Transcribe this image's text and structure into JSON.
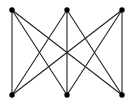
{
  "diagram": {
    "type": "complete-bipartite-graph",
    "name": "K3,3",
    "partitions": {
      "top": [
        "t1",
        "t2",
        "t3"
      ],
      "bottom": [
        "b1",
        "b2",
        "b3"
      ]
    },
    "nodes": [
      {
        "id": "t1",
        "row": "top",
        "col": 0
      },
      {
        "id": "t2",
        "row": "top",
        "col": 1
      },
      {
        "id": "t3",
        "row": "top",
        "col": 2
      },
      {
        "id": "b1",
        "row": "bottom",
        "col": 0
      },
      {
        "id": "b2",
        "row": "bottom",
        "col": 1
      },
      {
        "id": "b3",
        "row": "bottom",
        "col": 2
      }
    ],
    "edges": [
      [
        "t1",
        "b1"
      ],
      [
        "t1",
        "b2"
      ],
      [
        "t1",
        "b3"
      ],
      [
        "t2",
        "b1"
      ],
      [
        "t2",
        "b2"
      ],
      [
        "t2",
        "b3"
      ],
      [
        "t3",
        "b1"
      ],
      [
        "t3",
        "b2"
      ],
      [
        "t3",
        "b3"
      ]
    ],
    "colors": {
      "node": "#000000",
      "edge": "#222222",
      "background": "#ffffff"
    }
  }
}
